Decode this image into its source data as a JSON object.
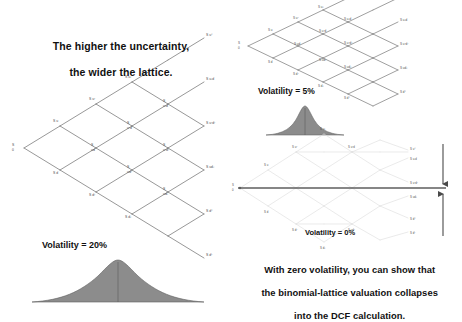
{
  "page": {
    "background": "#ffffff",
    "width": 462,
    "height": 311
  },
  "headline": {
    "line1": "The higher the uncertainty,",
    "line2": "the wider the lattice.",
    "text": "The higher the uncertainty,\nthe wider the lattice."
  },
  "conclusion": {
    "line1": "With zero volatility, you can show that",
    "line2": "the binomial-lattice valuation collapses",
    "line3": "into the DCF calculation.",
    "text": "With zero volatility, you can show that\nthe binomial-lattice valuation collapses\ninto the DCF calculation."
  },
  "labels": {
    "volatility_20": "Volatility = 20%",
    "volatility_5": "Volatility = 5%",
    "volatility_0": "Volatility = 0%"
  },
  "colors": {
    "lattice_stroke": "#6b6b6b",
    "lattice_ghost": "#d8d8d8",
    "curve_fill": "#8c8c8c",
    "curve_stroke": "#555555",
    "axis_dark": "#5a5a5a",
    "text": "#111111"
  },
  "lattices": {
    "wide": {
      "name": "volatility-20-lattice",
      "steps": 4,
      "spread": "wide",
      "root_label": "S0",
      "node_labels": [
        "S0",
        "S0u",
        "S0d",
        "S0u2",
        "S0ud",
        "S0d2",
        "S0u3",
        "S0u2d",
        "S0ud2",
        "S0d3",
        "S0u4",
        "S0u3d",
        "S0u2d2",
        "S0ud3",
        "S0d4"
      ]
    },
    "narrow": {
      "name": "volatility-5-lattice",
      "steps": 4,
      "spread": "narrow",
      "root_label": "S0",
      "node_labels": [
        "S0",
        "S0u",
        "S0d",
        "S0u2",
        "S0ud",
        "S0d2",
        "S0u3",
        "S0u2d",
        "S0ud2",
        "S0d3",
        "S0u4",
        "S0u3d",
        "S0u2d2",
        "S0ud3",
        "S0d4"
      ]
    },
    "collapsed": {
      "name": "volatility-0-lattice",
      "steps": 4,
      "spread": "collapsed",
      "root_label": "S0",
      "node_labels": [
        "S0",
        "S0u",
        "S0d",
        "S0u2",
        "S0ud",
        "S0d2",
        "S0u3",
        "S0u2d",
        "S0ud2",
        "S0d3",
        "S0u4",
        "S0u3d",
        "S0u2d2",
        "S0ud3",
        "S0d4"
      ],
      "collapse_arrows": 2
    }
  },
  "curves": {
    "wide_curve": {
      "name": "volatility-20-distribution",
      "width": 150,
      "height": 46,
      "sigma": "wide"
    },
    "narrow_curve": {
      "name": "volatility-5-distribution",
      "width": 78,
      "height": 34,
      "sigma": "narrow"
    }
  }
}
